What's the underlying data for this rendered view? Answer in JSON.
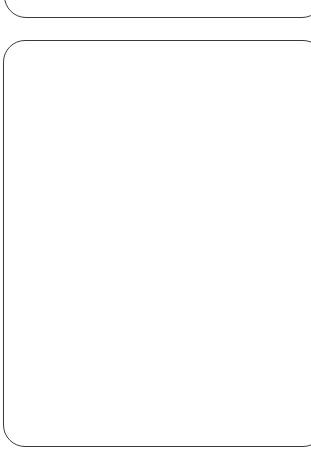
{
  "panels": [
    {
      "id": "top-panel",
      "content": "",
      "border_color": "#3a3a3a",
      "background": "#ffffff"
    },
    {
      "id": "bottom-panel",
      "content": "",
      "border_color": "#3a3a3a",
      "background": "#ffffff"
    }
  ]
}
